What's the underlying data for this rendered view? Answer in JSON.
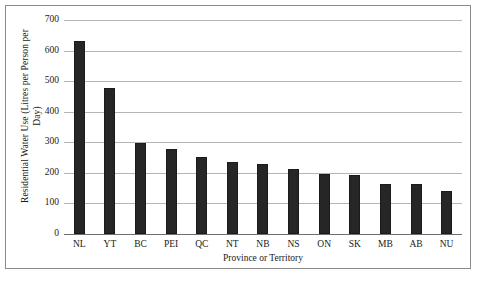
{
  "chart_data": {
    "type": "bar",
    "title": "",
    "subtitle": "",
    "xlabel": "Province or Territory",
    "ylabel": "Residential Water Use (Litres per Person per Day)",
    "ylabel_lines": [
      "Residential Water Use (Litres per Person per",
      "Day)"
    ],
    "categories": [
      "NL",
      "YT",
      "BC",
      "PEI",
      "QC",
      "NT",
      "NB",
      "NS",
      "ON",
      "SK",
      "MB",
      "AB",
      "NU"
    ],
    "values": [
      630,
      476,
      298,
      279,
      252,
      237,
      230,
      213,
      196,
      193,
      163,
      163,
      140
    ],
    "ylim": [
      0,
      700
    ],
    "yticks": [
      0,
      100,
      200,
      300,
      400,
      500,
      600,
      700
    ],
    "ytick_labels": [
      "0",
      "100",
      "200",
      "300",
      "400",
      "500",
      "600",
      "700"
    ],
    "grid": true,
    "grid_axis": "y",
    "legend": false,
    "legend_position": "none",
    "bar_color": "#262626",
    "grid_color": "#b5b5b5",
    "axis_color": "#6f6f6f",
    "border_color": "#8a8a8a",
    "background": "#ffffff"
  }
}
